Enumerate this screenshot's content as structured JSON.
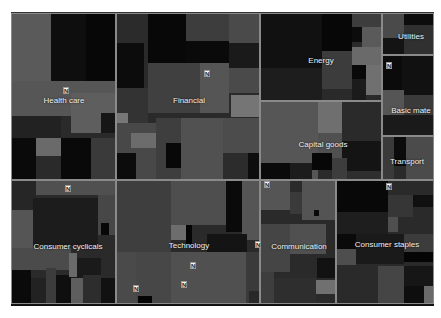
{
  "chart_data": {
    "type": "treemap",
    "title": "",
    "sectors": [
      {
        "name": "Health care",
        "x": 0,
        "y": 0,
        "w": 105,
        "h": 167,
        "label_x": 52,
        "label_y": 86,
        "marker": [
          51,
          73
        ]
      },
      {
        "name": "Financial",
        "x": 105,
        "y": 0,
        "w": 144,
        "h": 167,
        "label_x": 72,
        "label_y": 86,
        "marker": [
          87,
          56
        ]
      },
      {
        "name": "Energy",
        "x": 249,
        "y": 0,
        "w": 122,
        "h": 88,
        "label_x": 60,
        "label_y": 46,
        "marker": null
      },
      {
        "name": "Utilities",
        "x": 371,
        "y": 0,
        "w": 52,
        "h": 42,
        "label_x": 28,
        "label_y": 22,
        "marker": null
      },
      {
        "name": "Basic mate",
        "x": 371,
        "y": 42,
        "w": 52,
        "h": 81,
        "label_x": 28,
        "label_y": 54,
        "marker": [
          3,
          6
        ]
      },
      {
        "name": "Capital goods",
        "x": 249,
        "y": 88,
        "w": 122,
        "h": 79,
        "label_x": 62,
        "label_y": 42,
        "marker": null
      },
      {
        "name": "Transport",
        "x": 371,
        "y": 123,
        "w": 52,
        "h": 44,
        "label_x": 24,
        "label_y": 24,
        "marker": [
          3,
          46
        ]
      },
      {
        "name": "Consumer cyclicals",
        "x": 0,
        "y": 167,
        "w": 105,
        "h": 124,
        "label_x": 56,
        "label_y": 65,
        "marker": [
          53,
          4
        ]
      },
      {
        "name": "Technology",
        "x": 105,
        "y": 167,
        "w": 144,
        "h": 124,
        "label_x": 72,
        "label_y": 64,
        "marker": [
          73,
          81
        ]
      },
      {
        "name": "Communication",
        "x": 249,
        "y": 167,
        "w": 76,
        "h": 124,
        "label_x": 38,
        "label_y": 65,
        "marker": [
          -6,
          60
        ]
      },
      {
        "name": "Consumer staples",
        "x": 325,
        "y": 167,
        "w": 98,
        "h": 124,
        "label_x": 50,
        "label_y": 63,
        "marker": null
      }
    ],
    "extra_markers": [
      [
        133,
        284
      ],
      [
        181,
        280
      ],
      [
        264,
        180
      ]
    ]
  },
  "cells": [
    {
      "x": 0,
      "y": 0,
      "w": 40,
      "h": 80,
      "c": "#5a5a5a"
    },
    {
      "x": 40,
      "y": 0,
      "w": 35,
      "h": 68,
      "c": "#0e0e0e"
    },
    {
      "x": 75,
      "y": 0,
      "w": 30,
      "h": 68,
      "c": "#070707"
    },
    {
      "x": 0,
      "y": 68,
      "w": 105,
      "h": 35,
      "c": "#565656"
    },
    {
      "x": 60,
      "y": 80,
      "w": 45,
      "h": 40,
      "c": "#5e5e5e"
    },
    {
      "x": 0,
      "y": 103,
      "w": 50,
      "h": 22,
      "c": "#222222"
    },
    {
      "x": 0,
      "y": 125,
      "w": 25,
      "h": 42,
      "c": "#0a0a0a"
    },
    {
      "x": 25,
      "y": 125,
      "w": 25,
      "h": 18,
      "c": "#6a6a6a"
    },
    {
      "x": 25,
      "y": 143,
      "w": 25,
      "h": 24,
      "c": "#2a2a2a"
    },
    {
      "x": 50,
      "y": 125,
      "w": 30,
      "h": 42,
      "c": "#090909"
    },
    {
      "x": 80,
      "y": 125,
      "w": 25,
      "h": 42,
      "c": "#3a3a3a"
    },
    {
      "x": 90,
      "y": 100,
      "w": 15,
      "h": 20,
      "c": "#161616"
    },
    {
      "x": 105,
      "y": 0,
      "w": 32,
      "h": 30,
      "c": "#2b2b2b"
    },
    {
      "x": 105,
      "y": 30,
      "w": 28,
      "h": 45,
      "c": "#0c0c0c"
    },
    {
      "x": 137,
      "y": 0,
      "w": 38,
      "h": 50,
      "c": "#080808"
    },
    {
      "x": 175,
      "y": 0,
      "w": 43,
      "h": 28,
      "c": "#3d3d3d"
    },
    {
      "x": 175,
      "y": 28,
      "w": 43,
      "h": 22,
      "c": "#0a0a0a"
    },
    {
      "x": 218,
      "y": 0,
      "w": 31,
      "h": 80,
      "c": "#4a4a4a"
    },
    {
      "x": 137,
      "y": 50,
      "w": 52,
      "h": 50,
      "c": "#404040"
    },
    {
      "x": 189,
      "y": 50,
      "w": 29,
      "h": 50,
      "c": "#555555"
    },
    {
      "x": 218,
      "y": 30,
      "w": 31,
      "h": 25,
      "c": "#1a1a1a"
    },
    {
      "x": 220,
      "y": 82,
      "w": 29,
      "h": 22,
      "c": "#757575"
    },
    {
      "x": 105,
      "y": 75,
      "w": 32,
      "h": 35,
      "c": "#333333"
    },
    {
      "x": 105,
      "y": 100,
      "w": 12,
      "h": 14,
      "c": "#777777"
    },
    {
      "x": 105,
      "y": 110,
      "w": 40,
      "h": 57,
      "c": "#484848"
    },
    {
      "x": 120,
      "y": 120,
      "w": 25,
      "h": 15,
      "c": "#6c6c6c"
    },
    {
      "x": 105,
      "y": 140,
      "w": 20,
      "h": 27,
      "c": "#0c0c0c"
    },
    {
      "x": 145,
      "y": 105,
      "w": 25,
      "h": 62,
      "c": "#3e3e3e"
    },
    {
      "x": 155,
      "y": 130,
      "w": 18,
      "h": 25,
      "c": "#080808"
    },
    {
      "x": 170,
      "y": 105,
      "w": 42,
      "h": 62,
      "c": "#515151"
    },
    {
      "x": 212,
      "y": 105,
      "w": 37,
      "h": 35,
      "c": "#4c4c4c"
    },
    {
      "x": 212,
      "y": 140,
      "w": 25,
      "h": 27,
      "c": "#2c2c2c"
    },
    {
      "x": 237,
      "y": 140,
      "w": 12,
      "h": 27,
      "c": "#0d0d0d"
    },
    {
      "x": 249,
      "y": 0,
      "w": 62,
      "h": 55,
      "c": "#111111"
    },
    {
      "x": 311,
      "y": 0,
      "w": 30,
      "h": 38,
      "c": "#070707"
    },
    {
      "x": 249,
      "y": 55,
      "w": 62,
      "h": 33,
      "c": "#1d1d1d"
    },
    {
      "x": 311,
      "y": 38,
      "w": 30,
      "h": 38,
      "c": "#3c3c3c"
    },
    {
      "x": 341,
      "y": 0,
      "w": 30,
      "h": 14,
      "c": "#3d3d3d"
    },
    {
      "x": 341,
      "y": 14,
      "w": 10,
      "h": 15,
      "c": "#0c0c0c"
    },
    {
      "x": 351,
      "y": 14,
      "w": 20,
      "h": 20,
      "c": "#5a5a5a"
    },
    {
      "x": 341,
      "y": 34,
      "w": 30,
      "h": 18,
      "c": "#6a6a6a"
    },
    {
      "x": 341,
      "y": 52,
      "w": 14,
      "h": 14,
      "c": "#090909"
    },
    {
      "x": 355,
      "y": 52,
      "w": 16,
      "h": 30,
      "c": "#707070"
    },
    {
      "x": 341,
      "y": 66,
      "w": 14,
      "h": 22,
      "c": "#1b1b1b"
    },
    {
      "x": 311,
      "y": 76,
      "w": 30,
      "h": 12,
      "c": "#2a2a2a"
    },
    {
      "x": 371,
      "y": 0,
      "w": 22,
      "h": 25,
      "c": "#4a4a4a"
    },
    {
      "x": 393,
      "y": 0,
      "w": 30,
      "h": 12,
      "c": "#0c0c0c"
    },
    {
      "x": 371,
      "y": 25,
      "w": 22,
      "h": 17,
      "c": "#141414"
    },
    {
      "x": 393,
      "y": 12,
      "w": 30,
      "h": 30,
      "c": "#303030"
    },
    {
      "x": 371,
      "y": 42,
      "w": 20,
      "h": 35,
      "c": "#0b0b0b"
    },
    {
      "x": 391,
      "y": 42,
      "w": 32,
      "h": 40,
      "c": "#111111"
    },
    {
      "x": 371,
      "y": 77,
      "w": 22,
      "h": 25,
      "c": "#555555"
    },
    {
      "x": 393,
      "y": 82,
      "w": 30,
      "h": 20,
      "c": "#3a3a3a"
    },
    {
      "x": 371,
      "y": 102,
      "w": 52,
      "h": 21,
      "c": "#1a1a1a"
    },
    {
      "x": 249,
      "y": 88,
      "w": 58,
      "h": 79,
      "c": "#565656"
    },
    {
      "x": 307,
      "y": 88,
      "w": 24,
      "h": 32,
      "c": "#6f6f6f"
    },
    {
      "x": 331,
      "y": 88,
      "w": 40,
      "h": 40,
      "c": "#2a2a2a"
    },
    {
      "x": 331,
      "y": 128,
      "w": 40,
      "h": 30,
      "c": "#141414"
    },
    {
      "x": 307,
      "y": 120,
      "w": 24,
      "h": 25,
      "c": "#505050"
    },
    {
      "x": 249,
      "y": 150,
      "w": 30,
      "h": 17,
      "c": "#0a0a0a"
    },
    {
      "x": 279,
      "y": 150,
      "w": 22,
      "h": 17,
      "c": "#1c1c1c"
    },
    {
      "x": 301,
      "y": 140,
      "w": 20,
      "h": 17,
      "c": "#070707"
    },
    {
      "x": 321,
      "y": 145,
      "w": 15,
      "h": 22,
      "c": "#3d3d3d"
    },
    {
      "x": 336,
      "y": 158,
      "w": 35,
      "h": 9,
      "c": "#2e2e2e"
    },
    {
      "x": 371,
      "y": 123,
      "w": 12,
      "h": 44,
      "c": "#3a3a3a"
    },
    {
      "x": 383,
      "y": 123,
      "w": 12,
      "h": 30,
      "c": "#0b0b0b"
    },
    {
      "x": 395,
      "y": 123,
      "w": 28,
      "h": 44,
      "c": "#4b4b4b"
    },
    {
      "x": 0,
      "y": 167,
      "w": 25,
      "h": 30,
      "c": "#262626"
    },
    {
      "x": 25,
      "y": 167,
      "w": 80,
      "h": 15,
      "c": "#505050"
    },
    {
      "x": 22,
      "y": 185,
      "w": 65,
      "h": 48,
      "c": "#1c1c1c"
    },
    {
      "x": 0,
      "y": 197,
      "w": 22,
      "h": 38,
      "c": "#555555"
    },
    {
      "x": 87,
      "y": 182,
      "w": 18,
      "h": 40,
      "c": "#474747"
    },
    {
      "x": 90,
      "y": 210,
      "w": 8,
      "h": 12,
      "c": "#080808"
    },
    {
      "x": 0,
      "y": 235,
      "w": 60,
      "h": 22,
      "c": "#4b4b4b"
    },
    {
      "x": 60,
      "y": 245,
      "w": 30,
      "h": 20,
      "c": "#1a1a1a"
    },
    {
      "x": 0,
      "y": 257,
      "w": 20,
      "h": 34,
      "c": "#0a0a0a"
    },
    {
      "x": 20,
      "y": 265,
      "w": 15,
      "h": 26,
      "c": "#222222"
    },
    {
      "x": 35,
      "y": 255,
      "w": 10,
      "h": 36,
      "c": "#3c3c3c"
    },
    {
      "x": 45,
      "y": 262,
      "w": 15,
      "h": 29,
      "c": "#0f0f0f"
    },
    {
      "x": 60,
      "y": 265,
      "w": 12,
      "h": 26,
      "c": "#5e5e5e"
    },
    {
      "x": 72,
      "y": 262,
      "w": 18,
      "h": 29,
      "c": "#2d2d2d"
    },
    {
      "x": 90,
      "y": 265,
      "w": 15,
      "h": 26,
      "c": "#111111"
    },
    {
      "x": 58,
      "y": 240,
      "w": 8,
      "h": 24,
      "c": "#6a6a6a"
    },
    {
      "x": 105,
      "y": 167,
      "w": 55,
      "h": 72,
      "c": "#3e3e3e"
    },
    {
      "x": 160,
      "y": 167,
      "w": 55,
      "h": 45,
      "c": "#4e4e4e"
    },
    {
      "x": 215,
      "y": 167,
      "w": 16,
      "h": 52,
      "c": "#0a0a0a"
    },
    {
      "x": 231,
      "y": 167,
      "w": 18,
      "h": 60,
      "c": "#555555"
    },
    {
      "x": 160,
      "y": 212,
      "w": 15,
      "h": 15,
      "c": "#6d6d6d"
    },
    {
      "x": 175,
      "y": 212,
      "w": 6,
      "h": 20,
      "c": "#050505"
    },
    {
      "x": 196,
      "y": 221,
      "w": 40,
      "h": 18,
      "c": "#141414"
    },
    {
      "x": 105,
      "y": 239,
      "w": 20,
      "h": 52,
      "c": "#4a4a4a"
    },
    {
      "x": 125,
      "y": 239,
      "w": 35,
      "h": 52,
      "c": "#474747"
    },
    {
      "x": 160,
      "y": 239,
      "w": 75,
      "h": 52,
      "c": "#505050"
    },
    {
      "x": 127,
      "y": 283,
      "w": 14,
      "h": 8,
      "c": "#050505"
    },
    {
      "x": 235,
      "y": 239,
      "w": 14,
      "h": 52,
      "c": "#3a3a3a"
    },
    {
      "x": 238,
      "y": 278,
      "w": 11,
      "h": 13,
      "c": "#282828"
    },
    {
      "x": 249,
      "y": 167,
      "w": 30,
      "h": 30,
      "c": "#555555"
    },
    {
      "x": 279,
      "y": 179,
      "w": 12,
      "h": 22,
      "c": "#3a3a3a"
    },
    {
      "x": 291,
      "y": 167,
      "w": 34,
      "h": 40,
      "c": "#545454"
    },
    {
      "x": 303,
      "y": 197,
      "w": 5,
      "h": 6,
      "c": "#0a0a0a"
    },
    {
      "x": 249,
      "y": 211,
      "w": 30,
      "h": 48,
      "c": "#454545"
    },
    {
      "x": 279,
      "y": 211,
      "w": 36,
      "h": 30,
      "c": "#505050"
    },
    {
      "x": 306,
      "y": 245,
      "w": 19,
      "h": 20,
      "c": "#121212"
    },
    {
      "x": 249,
      "y": 259,
      "w": 14,
      "h": 32,
      "c": "#3e3e3e"
    },
    {
      "x": 263,
      "y": 265,
      "w": 42,
      "h": 26,
      "c": "#2e2e2e"
    },
    {
      "x": 305,
      "y": 267,
      "w": 20,
      "h": 14,
      "c": "#707070"
    },
    {
      "x": 325,
      "y": 167,
      "w": 52,
      "h": 32,
      "c": "#080808"
    },
    {
      "x": 377,
      "y": 167,
      "w": 46,
      "h": 15,
      "c": "#2a2a2a"
    },
    {
      "x": 377,
      "y": 182,
      "w": 25,
      "h": 22,
      "c": "#363636"
    },
    {
      "x": 402,
      "y": 182,
      "w": 21,
      "h": 12,
      "c": "#101010"
    },
    {
      "x": 325,
      "y": 199,
      "w": 52,
      "h": 22,
      "c": "#1e1e1e"
    },
    {
      "x": 377,
      "y": 204,
      "w": 10,
      "h": 15,
      "c": "#4f4f4f"
    },
    {
      "x": 325,
      "y": 221,
      "w": 20,
      "h": 15,
      "c": "#0a0a0a"
    },
    {
      "x": 345,
      "y": 221,
      "w": 48,
      "h": 30,
      "c": "#1a1a1a"
    },
    {
      "x": 393,
      "y": 221,
      "w": 30,
      "h": 18,
      "c": "#3c3c3c"
    },
    {
      "x": 325,
      "y": 236,
      "w": 20,
      "h": 16,
      "c": "#4e4e4e"
    },
    {
      "x": 393,
      "y": 239,
      "w": 30,
      "h": 10,
      "c": "#050505"
    },
    {
      "x": 325,
      "y": 253,
      "w": 42,
      "h": 38,
      "c": "#2a2a2a"
    },
    {
      "x": 367,
      "y": 253,
      "w": 26,
      "h": 38,
      "c": "#454545"
    },
    {
      "x": 393,
      "y": 253,
      "w": 30,
      "h": 20,
      "c": "#161616"
    },
    {
      "x": 393,
      "y": 273,
      "w": 20,
      "h": 18,
      "c": "#0e0e0e"
    },
    {
      "x": 413,
      "y": 273,
      "w": 10,
      "h": 18,
      "c": "#6a6a6a"
    }
  ],
  "marker_glyph": "N"
}
